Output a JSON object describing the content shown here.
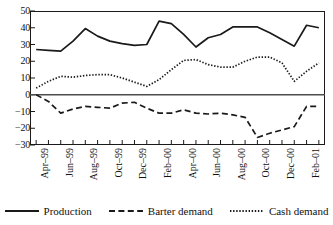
{
  "chart_data": {
    "type": "line",
    "title": "",
    "subtitle": "",
    "xlabel": "",
    "ylabel": "",
    "ylim": [
      -30,
      50
    ],
    "ytick_values": [
      50,
      40,
      30,
      20,
      10,
      0,
      -10,
      -20,
      -30
    ],
    "ytick_labels": [
      "50",
      "40",
      "30",
      "20",
      "10",
      "0",
      "−10",
      "−20",
      "−30"
    ],
    "grid": false,
    "zero_line": true,
    "legend_position": "bottom",
    "x": [
      "Apr-99",
      "May-99",
      "Jun-99",
      "Jul-99",
      "Aug-99",
      "Sep-99",
      "Oct-99",
      "Nov-99",
      "Dec-99",
      "Jan-00",
      "Feb-00",
      "Mar-00",
      "Apr-00",
      "May-00",
      "Jun-00",
      "Jul-00",
      "Aug-00",
      "Sep-00",
      "Oct-00",
      "Nov-00",
      "Dec-00",
      "Jan-01",
      "Feb-01",
      "Mar-01"
    ],
    "xtick_labels": [
      "Apr–99",
      "Jun–99",
      "Aug–99",
      "Oct–99",
      "Dec–99",
      "Feb–00",
      "Apr–00",
      "Jun–00",
      "Aug–00",
      "Oct–00",
      "Dec–00",
      "Feb–01"
    ],
    "xtick_indices": [
      0,
      2,
      4,
      6,
      8,
      10,
      12,
      14,
      16,
      18,
      20,
      22
    ],
    "series": [
      {
        "name": "Production",
        "style": "solid",
        "color": "#1a1a1a",
        "values": [
          27,
          26.5,
          26,
          32,
          39.5,
          35,
          32,
          30.5,
          29.5,
          30,
          44,
          42.5,
          36,
          28.5,
          34,
          36,
          40.5,
          40.5,
          40.5,
          37,
          33,
          29,
          41.5,
          40
        ]
      },
      {
        "name": "Barter demand",
        "style": "dashed",
        "color": "#1a1a1a",
        "values": [
          0,
          -4,
          -11,
          -8.5,
          -7,
          -7.5,
          -8,
          -5,
          -4.5,
          -8,
          -11,
          -11,
          -9,
          -11,
          -11.5,
          -11,
          -12,
          -13.5,
          -25.5,
          -23,
          -21,
          -19,
          -7,
          -7
        ]
      },
      {
        "name": "Cash demand",
        "style": "dotted",
        "color": "#1a1a1a",
        "values": [
          4,
          8,
          11,
          10.5,
          11.5,
          12,
          12,
          10,
          7.5,
          5,
          9,
          15,
          20.5,
          21,
          18,
          16.5,
          16.5,
          20,
          22.5,
          22.5,
          19,
          8,
          14,
          19
        ]
      }
    ]
  },
  "legend": {
    "items": [
      {
        "label": "Production",
        "style": "solid"
      },
      {
        "label": "Barter demand",
        "style": "dashed"
      },
      {
        "label": "Cash demand",
        "style": "dotted"
      }
    ]
  }
}
